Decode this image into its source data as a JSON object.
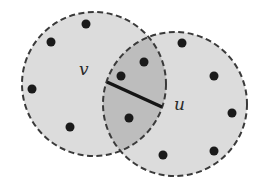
{
  "diagram": {
    "type": "overlapping-disks",
    "colors": {
      "background": "#ffffff",
      "disk_fill": "#dcdcdc",
      "intersection_fill": "#bdbdbd",
      "disk_stroke": "#3a3a3a",
      "node": "#1a1a1a",
      "edge": "#151515"
    },
    "disks": [
      {
        "id": "disk-v",
        "cx": 94,
        "cy": 84,
        "r": 72
      },
      {
        "id": "disk-u",
        "cx": 175,
        "cy": 104,
        "r": 72
      }
    ],
    "labels": [
      {
        "id": "label-v",
        "text": "v",
        "x": 79,
        "y": 75
      },
      {
        "id": "label-u",
        "text": "u",
        "x": 174,
        "y": 110
      }
    ],
    "edge": {
      "x1": 107,
      "y1": 82,
      "x2": 162,
      "y2": 107,
      "width": 3.5
    },
    "nodes": [
      {
        "x": 86,
        "y": 24
      },
      {
        "x": 51,
        "y": 42
      },
      {
        "x": 32,
        "y": 89
      },
      {
        "x": 70,
        "y": 127
      },
      {
        "x": 144,
        "y": 62
      },
      {
        "x": 121,
        "y": 76
      },
      {
        "x": 129,
        "y": 118
      },
      {
        "x": 182,
        "y": 43
      },
      {
        "x": 214,
        "y": 76
      },
      {
        "x": 232,
        "y": 113
      },
      {
        "x": 214,
        "y": 151
      },
      {
        "x": 163,
        "y": 155
      }
    ],
    "node_radius": 4.5
  }
}
